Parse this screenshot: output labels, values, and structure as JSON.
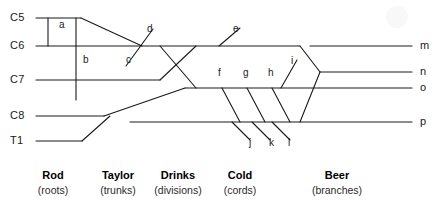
{
  "diagram": {
    "type": "lineage-tree-diagram",
    "background": "#ffffff",
    "stroke_color": "#1a1a1a",
    "left_nodes": [
      {
        "id": "C5",
        "label": "C5",
        "y": 18
      },
      {
        "id": "C6",
        "label": "C6",
        "y": 46
      },
      {
        "id": "C7",
        "label": "C7",
        "y": 80
      },
      {
        "id": "C8",
        "label": "C8",
        "y": 116
      },
      {
        "id": "T1",
        "label": "T1",
        "y": 141
      }
    ],
    "right_nodes": [
      {
        "id": "m",
        "label": "m",
        "y": 46
      },
      {
        "id": "n",
        "label": "n",
        "y": 72
      },
      {
        "id": "o",
        "label": "o",
        "y": 88
      },
      {
        "id": "p",
        "label": "p",
        "y": 122
      }
    ],
    "segment_labels": [
      {
        "id": "a",
        "label": "a",
        "x": 59,
        "y": 25
      },
      {
        "id": "b",
        "label": "b",
        "x": 83,
        "y": 60
      },
      {
        "id": "c",
        "label": "c",
        "x": 126,
        "y": 60
      },
      {
        "id": "d",
        "label": "d",
        "x": 147,
        "y": 29
      },
      {
        "id": "e",
        "label": "e",
        "x": 233,
        "y": 29
      },
      {
        "id": "f",
        "label": "f",
        "x": 218,
        "y": 73
      },
      {
        "id": "g",
        "label": "g",
        "x": 243,
        "y": 73
      },
      {
        "id": "h",
        "label": "h",
        "x": 268,
        "y": 73
      },
      {
        "id": "i",
        "label": "i",
        "x": 291,
        "y": 61
      },
      {
        "id": "j",
        "label": "j",
        "x": 249,
        "y": 143
      },
      {
        "id": "k",
        "label": "k",
        "x": 269,
        "y": 143
      },
      {
        "id": "l",
        "label": "l",
        "x": 288,
        "y": 143
      }
    ],
    "categories": [
      {
        "name": "Rod",
        "sub": "(roots)",
        "x": 53
      },
      {
        "name": "Taylor",
        "sub": "(trunks)",
        "x": 118
      },
      {
        "name": "Drinks",
        "sub": "(divisions)",
        "x": 178
      },
      {
        "name": "Cold",
        "sub": "(cords)",
        "x": 240
      },
      {
        "name": "Beer",
        "sub": "(branches)",
        "x": 337
      }
    ]
  },
  "chart_data": {
    "type": "diagram",
    "title": "",
    "paths": {
      "horizontal_lines": [
        {
          "name": "C5-line",
          "x1": 36,
          "y1": 18,
          "x2": 81,
          "y2": 18
        },
        {
          "name": "C6-line",
          "x1": 36,
          "y1": 46,
          "x2": 300,
          "y2": 46
        },
        {
          "name": "m-line",
          "x1": 310,
          "y1": 46,
          "x2": 412,
          "y2": 46
        },
        {
          "name": "C7-line",
          "x1": 36,
          "y1": 80,
          "x2": 160,
          "y2": 80
        },
        {
          "name": "o-line",
          "x1": 185,
          "y1": 88,
          "x2": 412,
          "y2": 88
        },
        {
          "name": "n-line",
          "x1": 320,
          "y1": 72,
          "x2": 412,
          "y2": 72
        },
        {
          "name": "C8-line",
          "x1": 36,
          "y1": 116,
          "x2": 104,
          "y2": 116
        },
        {
          "name": "p-line",
          "x1": 130,
          "y1": 122,
          "x2": 412,
          "y2": 122
        },
        {
          "name": "T1-line",
          "x1": 36,
          "y1": 141,
          "x2": 82,
          "y2": 141
        }
      ],
      "connectors": [
        {
          "name": "a-vertical",
          "x1": 48,
          "y1": 18,
          "x2": 48,
          "y2": 46
        },
        {
          "name": "b-vertical",
          "x1": 76,
          "y1": 18,
          "x2": 76,
          "y2": 100
        },
        {
          "name": "C5-to-C6-diagonal",
          "x1": 81,
          "y1": 18,
          "x2": 142,
          "y2": 46
        },
        {
          "name": "C7-up-cross",
          "x1": 160,
          "y1": 80,
          "x2": 196,
          "y2": 46
        },
        {
          "name": "C6-down-cross",
          "x1": 160,
          "y1": 46,
          "x2": 196,
          "y2": 88
        },
        {
          "name": "C8-to-p-diagonal",
          "x1": 104,
          "y1": 116,
          "x2": 185,
          "y2": 88
        },
        {
          "name": "T1-to-C8-diagonal",
          "x1": 82,
          "y1": 141,
          "x2": 110,
          "y2": 116
        },
        {
          "name": "m-join-upper",
          "x1": 300,
          "y1": 46,
          "x2": 320,
          "y2": 72
        },
        {
          "name": "p-join-lower",
          "x1": 300,
          "y1": 122,
          "x2": 320,
          "y2": 72
        }
      ],
      "ticks": [
        {
          "name": "d-c-tick",
          "x1": 153,
          "y1": 29,
          "x2": 126,
          "y2": 66
        },
        {
          "name": "e-tick",
          "x1": 240,
          "y1": 28,
          "x2": 219,
          "y2": 46
        },
        {
          "name": "f-tick",
          "x1": 222,
          "y1": 88,
          "x2": 240,
          "y2": 122
        },
        {
          "name": "g-tick",
          "x1": 247,
          "y1": 88,
          "x2": 265,
          "y2": 122
        },
        {
          "name": "h-tick",
          "x1": 272,
          "y1": 88,
          "x2": 290,
          "y2": 122
        },
        {
          "name": "i-tick",
          "x1": 297,
          "y1": 60,
          "x2": 281,
          "y2": 88
        },
        {
          "name": "j-tick",
          "x1": 232,
          "y1": 122,
          "x2": 250,
          "y2": 140
        },
        {
          "name": "k-tick",
          "x1": 252,
          "y1": 122,
          "x2": 270,
          "y2": 140
        },
        {
          "name": "l-tick",
          "x1": 272,
          "y1": 122,
          "x2": 290,
          "y2": 140
        }
      ]
    }
  }
}
